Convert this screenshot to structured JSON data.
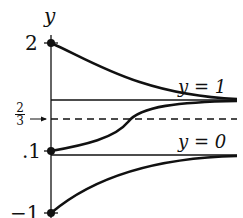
{
  "axis": {
    "label": "y"
  },
  "ticks": {
    "two": "2",
    "one_tenth": ".1",
    "neg_one": "−1",
    "frac_num": "2",
    "frac_den": "3"
  },
  "lines": {
    "upper": "y = 1",
    "lower": "y = 0"
  },
  "colors": {
    "ink": "#111111"
  }
}
